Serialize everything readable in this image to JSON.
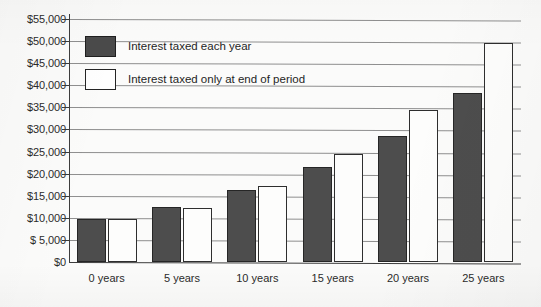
{
  "chart_data": {
    "type": "bar",
    "title": "",
    "xlabel": "",
    "ylabel": "",
    "categories": [
      "0 years",
      "5 years",
      "10 years",
      "15 years",
      "20 years",
      "25 years"
    ],
    "series": [
      {
        "name": "Interest taxed each year",
        "color": "#4d4d4d",
        "values": [
          9800,
          12400,
          16300,
          21500,
          28500,
          38200
        ]
      },
      {
        "name": "Interest taxed only at end of period",
        "color": "#ffffff",
        "values": [
          9800,
          12200,
          17300,
          24500,
          34300,
          49500
        ]
      }
    ],
    "ylim": [
      0,
      55000
    ],
    "ytick_values": [
      0,
      5000,
      10000,
      15000,
      20000,
      25000,
      30000,
      35000,
      40000,
      45000,
      50000,
      55000
    ],
    "ytick_labels": [
      "$0",
      "$ 5,000",
      "$10,000",
      "$15,000",
      "$20,000",
      "$25,000",
      "$30,000",
      "$35,000",
      "$40,000",
      "$45,000",
      "$50,000",
      "$55,000"
    ],
    "grid": true,
    "legend_position": "upper left inside plot area"
  },
  "legend": {
    "entries": [
      {
        "label": "Interest taxed each year",
        "style": "dark"
      },
      {
        "label": "Interest taxed only at end of period",
        "style": "light"
      }
    ]
  }
}
